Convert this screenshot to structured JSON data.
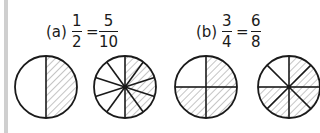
{
  "problems": [
    {
      "label": "(a)",
      "left": {
        "numerator": "1",
        "denominator": "2"
      },
      "equals": "=",
      "right": {
        "numerator": "5",
        "denominator": "10"
      },
      "pies": [
        {
          "center": [
            46,
            87
          ],
          "radius": 31,
          "slices": 2,
          "shaded": 1
        },
        {
          "center": [
            125,
            87
          ],
          "radius": 31,
          "slices": 10,
          "shaded": 5
        }
      ]
    },
    {
      "label": "(b)",
      "left": {
        "numerator": "3",
        "denominator": "4"
      },
      "equals": "=",
      "right": {
        "numerator": "6",
        "denominator": "8"
      },
      "pies": [
        {
          "center": [
            206,
            87
          ],
          "radius": 31,
          "slices": 4,
          "shaded": 3
        },
        {
          "center": [
            289,
            87
          ],
          "radius": 31,
          "slices": 8,
          "shaded": 6
        }
      ]
    }
  ],
  "colors": {
    "stroke": "#1a1a1a",
    "hatch": "#8a8a8a",
    "border": "#cfcfcf"
  }
}
